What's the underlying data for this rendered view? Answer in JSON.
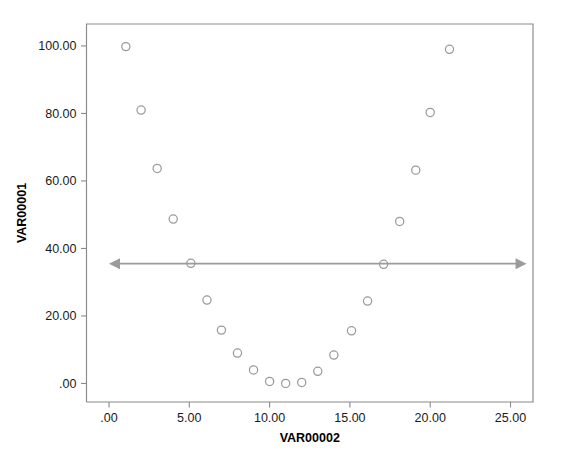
{
  "chart_data": {
    "type": "scatter",
    "title": "",
    "xlabel": "VAR00002",
    "ylabel": "VAR00001",
    "xlim": [
      -1.4,
      26.4
    ],
    "ylim": [
      -5.5,
      106.5
    ],
    "xticks": [
      0,
      5,
      10,
      15,
      20,
      25
    ],
    "xtick_labels": [
      ".00",
      "5.00",
      "10.00",
      "15.00",
      "20.00",
      "25.00"
    ],
    "yticks": [
      0,
      20,
      40,
      60,
      80,
      100
    ],
    "ytick_labels": [
      ".00",
      "20.00",
      "40.00",
      "60.00",
      "80.00",
      "100.00"
    ],
    "grid": false,
    "legend": null,
    "marker": "open-circle",
    "marker_color": "#9a9a9a",
    "frame_color": "#8a8a8a",
    "points": [
      {
        "x": 1.05,
        "y": 99.8
      },
      {
        "x": 2.0,
        "y": 81.0
      },
      {
        "x": 3.0,
        "y": 63.7
      },
      {
        "x": 4.0,
        "y": 48.7
      },
      {
        "x": 5.1,
        "y": 35.6
      },
      {
        "x": 6.1,
        "y": 24.7
      },
      {
        "x": 7.0,
        "y": 15.8
      },
      {
        "x": 8.0,
        "y": 9.0
      },
      {
        "x": 9.0,
        "y": 4.0
      },
      {
        "x": 10.0,
        "y": 0.6
      },
      {
        "x": 11.0,
        "y": 0.0
      },
      {
        "x": 12.0,
        "y": 0.3
      },
      {
        "x": 13.0,
        "y": 3.6
      },
      {
        "x": 14.0,
        "y": 8.4
      },
      {
        "x": 15.1,
        "y": 15.6
      },
      {
        "x": 16.1,
        "y": 24.4
      },
      {
        "x": 17.1,
        "y": 35.3
      },
      {
        "x": 18.1,
        "y": 48.0
      },
      {
        "x": 19.1,
        "y": 63.2
      },
      {
        "x": 20.0,
        "y": 80.3
      },
      {
        "x": 21.2,
        "y": 99.0
      }
    ],
    "annotations": [
      {
        "name": "double-headed-horizontal-arrow",
        "type": "double-arrow",
        "y": 35.5,
        "x_start": 0.0,
        "x_end": 26.0,
        "color": "#9b9b9b"
      }
    ]
  }
}
